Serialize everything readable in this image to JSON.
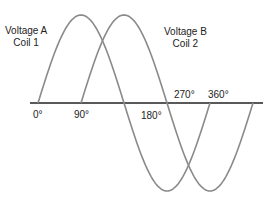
{
  "diagram": {
    "curves": [
      {
        "name": "Voltage A",
        "coil": "Coil 1",
        "phase_deg": 0,
        "color": "#8a8a8a"
      },
      {
        "name": "Voltage B",
        "coil": "Coil 2",
        "phase_deg": 90,
        "color": "#8a8a8a"
      }
    ],
    "labels": {
      "a_line1": "Voltage A",
      "a_line2": "Coil 1",
      "b_line1": "Voltage B",
      "b_line2": "Coil 2"
    },
    "ticks": {
      "t0": "0°",
      "t90": "90°",
      "t180": "180°",
      "t270": "270°",
      "t360": "360°"
    },
    "axis_color": "#222222"
  }
}
